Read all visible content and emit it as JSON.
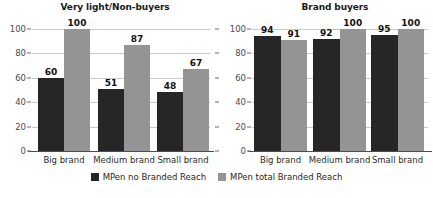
{
  "chart_data": [
    {
      "type": "bar",
      "title": "Very light/Non-buyers",
      "xlabel": "",
      "ylabel": "",
      "ylim": [
        0,
        100
      ],
      "yticks": [
        0,
        20,
        40,
        60,
        80,
        100
      ],
      "grid": true,
      "categories": [
        "Big brand",
        "Medium brand",
        "Small brand"
      ],
      "series": [
        {
          "name": "MPen no Branded Reach",
          "color": "#262626",
          "values": [
            60,
            51,
            48
          ]
        },
        {
          "name": "MPen total Branded Reach",
          "color": "#949494",
          "values": [
            100,
            87,
            67
          ]
        }
      ]
    },
    {
      "type": "bar",
      "title": "Brand buyers",
      "xlabel": "",
      "ylabel": "",
      "ylim": [
        0,
        100
      ],
      "yticks": [
        0,
        20,
        40,
        60,
        80,
        100
      ],
      "grid": true,
      "categories": [
        "Big brand",
        "Medium brand",
        "Small brand"
      ],
      "series": [
        {
          "name": "MPen no Branded Reach",
          "color": "#262626",
          "values": [
            94,
            92,
            95
          ]
        },
        {
          "name": "MPen total Branded Reach",
          "color": "#949494",
          "values": [
            91,
            100,
            100
          ]
        }
      ]
    }
  ],
  "legend": {
    "position": "bottom-center",
    "entries": [
      {
        "label": "MPen no Branded Reach",
        "color": "#262626"
      },
      {
        "label": "MPen total Branded Reach",
        "color": "#949494"
      }
    ]
  },
  "axis": {
    "tick_labels": [
      "100",
      "80",
      "60",
      "40",
      "20",
      "0"
    ]
  }
}
